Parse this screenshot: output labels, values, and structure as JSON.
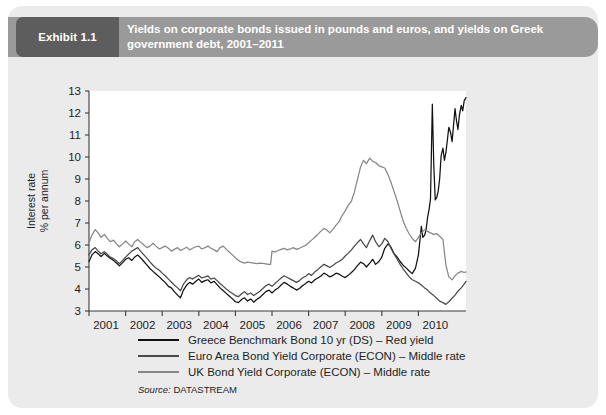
{
  "exhibit": {
    "badge": "Exhibit 1.1",
    "title": "Yields on corporate bonds issued in pounds and euros, and yields on Greek government debt, 2001–2011"
  },
  "source": {
    "label": "Source:",
    "value": "DATASTREAM"
  },
  "colors": {
    "card_background": "#ebebeb",
    "header_bar": "#9a9a9a",
    "badge": "#5d5d5d",
    "plot_background": "#ffffff",
    "greece": "#111111",
    "euro_area": "#4a4a4a",
    "uk": "#868686",
    "axis": "#3a3a3a"
  },
  "chart_data": {
    "type": "line",
    "title": "Yields on corporate bonds issued in pounds and euros, and yields on Greek government debt, 2001–2011",
    "xlabel": "",
    "ylabel": "Interest rate % per annum",
    "ylabel_lines": [
      "Interest rate",
      "% per annum"
    ],
    "ylim": [
      3,
      13
    ],
    "yticks": [
      3,
      4,
      5,
      6,
      7,
      8,
      9,
      10,
      11,
      12,
      13
    ],
    "xlim": [
      2001.0,
      2011.3
    ],
    "xticks": [
      2001,
      2002,
      2003,
      2004,
      2005,
      2006,
      2007,
      2008,
      2009,
      2010
    ],
    "xtick_labels": [
      "2001",
      "2002",
      "2003",
      "2004",
      "2005",
      "2006",
      "2007",
      "2008",
      "2009",
      "2010"
    ],
    "grid": false,
    "legend_position": "below-plot",
    "series": [
      {
        "name": "Greece Benchmark Bond 10 yr (DS) – Red yield",
        "color": "#111111",
        "x": [
          2001.0,
          2001.08,
          2001.17,
          2001.25,
          2001.33,
          2001.42,
          2001.5,
          2001.58,
          2001.67,
          2001.75,
          2001.83,
          2001.92,
          2002.0,
          2002.08,
          2002.17,
          2002.25,
          2002.33,
          2002.42,
          2002.5,
          2002.58,
          2002.67,
          2002.75,
          2002.83,
          2002.92,
          2003.0,
          2003.08,
          2003.17,
          2003.25,
          2003.33,
          2003.42,
          2003.5,
          2003.58,
          2003.67,
          2003.75,
          2003.83,
          2003.92,
          2004.0,
          2004.08,
          2004.17,
          2004.25,
          2004.33,
          2004.42,
          2004.5,
          2004.58,
          2004.67,
          2004.75,
          2004.83,
          2004.92,
          2005.0,
          2005.08,
          2005.17,
          2005.25,
          2005.33,
          2005.42,
          2005.5,
          2005.58,
          2005.67,
          2005.75,
          2005.83,
          2005.92,
          2006.0,
          2006.08,
          2006.17,
          2006.25,
          2006.33,
          2006.42,
          2006.5,
          2006.58,
          2006.67,
          2006.75,
          2006.83,
          2006.92,
          2007.0,
          2007.08,
          2007.17,
          2007.25,
          2007.33,
          2007.42,
          2007.5,
          2007.58,
          2007.67,
          2007.75,
          2007.83,
          2007.92,
          2008.0,
          2008.08,
          2008.17,
          2008.25,
          2008.33,
          2008.42,
          2008.5,
          2008.58,
          2008.67,
          2008.75,
          2008.83,
          2008.92,
          2009.0,
          2009.08,
          2009.17,
          2009.25,
          2009.33,
          2009.42,
          2009.5,
          2009.58,
          2009.67,
          2009.75,
          2009.83,
          2009.92,
          2010.0,
          2010.04,
          2010.08,
          2010.12,
          2010.17,
          2010.21,
          2010.25,
          2010.29,
          2010.33,
          2010.38,
          2010.42,
          2010.46,
          2010.5,
          2010.54,
          2010.58,
          2010.62,
          2010.67,
          2010.71,
          2010.75,
          2010.79,
          2010.83,
          2010.88,
          2010.92,
          2010.96,
          2011.0,
          2011.04,
          2011.08,
          2011.12,
          2011.17,
          2011.21,
          2011.25,
          2011.3
        ],
        "values": [
          5.25,
          5.55,
          5.7,
          5.6,
          5.48,
          5.62,
          5.5,
          5.4,
          5.3,
          5.18,
          5.05,
          5.2,
          5.35,
          5.42,
          5.3,
          5.45,
          5.55,
          5.4,
          5.25,
          5.1,
          4.92,
          4.8,
          4.68,
          4.55,
          4.42,
          4.3,
          4.12,
          4.05,
          3.88,
          3.72,
          3.6,
          3.95,
          4.18,
          4.3,
          4.22,
          4.35,
          4.45,
          4.3,
          4.38,
          4.42,
          4.28,
          4.35,
          4.2,
          4.05,
          3.92,
          3.8,
          3.68,
          3.55,
          3.42,
          3.38,
          3.52,
          3.6,
          3.45,
          3.55,
          3.4,
          3.52,
          3.62,
          3.75,
          3.88,
          3.95,
          3.82,
          3.95,
          4.05,
          4.18,
          4.3,
          4.22,
          4.12,
          4.05,
          3.95,
          4.02,
          4.15,
          4.25,
          4.35,
          4.28,
          4.42,
          4.5,
          4.58,
          4.72,
          4.65,
          4.55,
          4.62,
          4.72,
          4.68,
          4.58,
          4.52,
          4.62,
          4.75,
          4.88,
          5.05,
          5.22,
          5.15,
          5.0,
          5.18,
          5.35,
          5.12,
          5.25,
          5.45,
          5.85,
          6.05,
          5.9,
          5.62,
          5.45,
          5.25,
          5.08,
          4.95,
          4.82,
          4.7,
          4.95,
          5.55,
          6.2,
          6.85,
          6.35,
          6.45,
          6.7,
          7.25,
          7.6,
          8.1,
          12.4,
          9.6,
          8.05,
          8.15,
          8.45,
          9.0,
          10.05,
          10.4,
          9.85,
          10.2,
          10.75,
          11.35,
          11.1,
          10.7,
          11.45,
          12.2,
          11.65,
          11.25,
          11.9,
          12.35,
          12.1,
          12.55,
          12.7
        ]
      },
      {
        "name": "Euro Area Bond Yield Corporate (ECON) – Middle rate",
        "color": "#4a4a4a",
        "x": [
          2001.0,
          2001.08,
          2001.17,
          2001.25,
          2001.33,
          2001.42,
          2001.5,
          2001.58,
          2001.67,
          2001.75,
          2001.83,
          2001.92,
          2002.0,
          2002.08,
          2002.17,
          2002.25,
          2002.33,
          2002.42,
          2002.5,
          2002.58,
          2002.67,
          2002.75,
          2002.83,
          2002.92,
          2003.0,
          2003.08,
          2003.17,
          2003.25,
          2003.33,
          2003.42,
          2003.5,
          2003.58,
          2003.67,
          2003.75,
          2003.83,
          2003.92,
          2004.0,
          2004.08,
          2004.17,
          2004.25,
          2004.33,
          2004.42,
          2004.5,
          2004.58,
          2004.67,
          2004.75,
          2004.83,
          2004.92,
          2005.0,
          2005.08,
          2005.17,
          2005.25,
          2005.33,
          2005.42,
          2005.5,
          2005.58,
          2005.67,
          2005.75,
          2005.83,
          2005.92,
          2006.0,
          2006.08,
          2006.17,
          2006.25,
          2006.33,
          2006.42,
          2006.5,
          2006.58,
          2006.67,
          2006.75,
          2006.83,
          2006.92,
          2007.0,
          2007.08,
          2007.17,
          2007.25,
          2007.33,
          2007.42,
          2007.5,
          2007.58,
          2007.67,
          2007.75,
          2007.83,
          2007.92,
          2008.0,
          2008.08,
          2008.17,
          2008.25,
          2008.33,
          2008.42,
          2008.5,
          2008.58,
          2008.67,
          2008.75,
          2008.83,
          2008.92,
          2009.0,
          2009.08,
          2009.17,
          2009.25,
          2009.33,
          2009.42,
          2009.5,
          2009.58,
          2009.67,
          2009.75,
          2009.83,
          2009.92,
          2010.0,
          2010.08,
          2010.17,
          2010.25,
          2010.33,
          2010.42,
          2010.5,
          2010.58,
          2010.67,
          2010.75,
          2010.83,
          2010.92,
          2011.0,
          2011.08,
          2011.17,
          2011.25,
          2011.3
        ],
        "values": [
          5.55,
          5.78,
          5.88,
          5.72,
          5.6,
          5.7,
          5.58,
          5.45,
          5.38,
          5.28,
          5.15,
          5.3,
          5.45,
          5.58,
          5.72,
          5.8,
          5.88,
          5.7,
          5.55,
          5.4,
          5.22,
          5.08,
          4.95,
          4.85,
          4.72,
          4.6,
          4.45,
          4.32,
          4.18,
          4.05,
          3.92,
          4.22,
          4.42,
          4.52,
          4.45,
          4.55,
          4.62,
          4.5,
          4.55,
          4.6,
          4.45,
          4.5,
          4.38,
          4.25,
          4.12,
          4.0,
          3.9,
          3.8,
          3.7,
          3.65,
          3.78,
          3.88,
          3.75,
          3.82,
          3.7,
          3.8,
          3.9,
          4.02,
          4.15,
          4.22,
          4.12,
          4.25,
          4.38,
          4.5,
          4.6,
          4.52,
          4.45,
          4.38,
          4.3,
          4.38,
          4.5,
          4.58,
          4.7,
          4.62,
          4.78,
          4.88,
          5.0,
          5.12,
          5.05,
          4.98,
          5.08,
          5.18,
          5.25,
          5.35,
          5.5,
          5.62,
          5.78,
          5.95,
          6.1,
          6.25,
          6.05,
          5.88,
          6.2,
          6.45,
          6.15,
          5.92,
          6.05,
          6.3,
          6.15,
          5.85,
          5.6,
          5.35,
          5.12,
          4.92,
          4.72,
          4.55,
          4.42,
          4.35,
          4.28,
          4.18,
          4.05,
          3.95,
          3.82,
          3.7,
          3.58,
          3.45,
          3.38,
          3.3,
          3.42,
          3.58,
          3.72,
          3.9,
          4.05,
          4.22,
          4.35
        ]
      },
      {
        "name": "UK Bond Yield Corporate (ECON) – Middle rate",
        "color": "#868686",
        "x": [
          2001.0,
          2001.08,
          2001.17,
          2001.25,
          2001.33,
          2001.42,
          2001.5,
          2001.58,
          2001.67,
          2001.75,
          2001.83,
          2001.92,
          2002.0,
          2002.08,
          2002.17,
          2002.25,
          2002.33,
          2002.42,
          2002.5,
          2002.58,
          2002.67,
          2002.75,
          2002.83,
          2002.92,
          2003.0,
          2003.08,
          2003.17,
          2003.25,
          2003.33,
          2003.42,
          2003.5,
          2003.58,
          2003.67,
          2003.75,
          2003.83,
          2003.92,
          2004.0,
          2004.08,
          2004.17,
          2004.25,
          2004.33,
          2004.42,
          2004.5,
          2004.58,
          2004.67,
          2004.75,
          2004.83,
          2004.92,
          2005.0,
          2005.08,
          2005.17,
          2005.25,
          2005.33,
          2005.42,
          2005.5,
          2005.58,
          2005.67,
          2005.75,
          2005.83,
          2005.92,
          2005.96,
          2006.0,
          2006.08,
          2006.17,
          2006.25,
          2006.33,
          2006.42,
          2006.5,
          2006.58,
          2006.67,
          2006.75,
          2006.83,
          2006.92,
          2007.0,
          2007.08,
          2007.17,
          2007.25,
          2007.33,
          2007.42,
          2007.5,
          2007.58,
          2007.67,
          2007.75,
          2007.83,
          2007.92,
          2008.0,
          2008.08,
          2008.17,
          2008.25,
          2008.33,
          2008.42,
          2008.5,
          2008.58,
          2008.67,
          2008.75,
          2008.83,
          2008.92,
          2009.0,
          2009.08,
          2009.17,
          2009.25,
          2009.33,
          2009.42,
          2009.5,
          2009.58,
          2009.67,
          2009.75,
          2009.83,
          2009.92,
          2010.0,
          2010.08,
          2010.17,
          2010.25,
          2010.33,
          2010.42,
          2010.5,
          2010.58,
          2010.67,
          2010.75,
          2010.83,
          2010.92,
          2011.0,
          2011.08,
          2011.17,
          2011.25,
          2011.3
        ],
        "values": [
          6.1,
          6.45,
          6.7,
          6.55,
          6.35,
          6.48,
          6.3,
          6.15,
          6.22,
          6.05,
          5.92,
          6.05,
          6.18,
          6.05,
          5.92,
          6.15,
          6.25,
          6.12,
          6.0,
          5.88,
          5.95,
          6.08,
          5.95,
          5.82,
          5.88,
          5.95,
          5.85,
          5.72,
          5.8,
          5.88,
          5.75,
          5.82,
          5.9,
          5.78,
          5.85,
          5.92,
          5.95,
          5.82,
          5.88,
          5.95,
          5.85,
          5.78,
          5.7,
          5.88,
          5.95,
          5.8,
          5.68,
          5.55,
          5.42,
          5.3,
          5.22,
          5.18,
          5.22,
          5.2,
          5.18,
          5.15,
          5.18,
          5.16,
          5.14,
          5.12,
          5.12,
          5.72,
          5.68,
          5.75,
          5.8,
          5.85,
          5.78,
          5.82,
          5.88,
          5.8,
          5.85,
          5.92,
          5.98,
          6.1,
          6.22,
          6.35,
          6.48,
          6.62,
          6.75,
          6.68,
          6.55,
          6.72,
          6.9,
          7.05,
          7.35,
          7.55,
          7.8,
          8.0,
          8.4,
          8.95,
          9.55,
          9.85,
          9.7,
          9.95,
          9.8,
          9.75,
          9.6,
          9.55,
          9.5,
          9.2,
          8.85,
          8.45,
          8.0,
          7.55,
          7.1,
          6.75,
          6.5,
          6.3,
          6.15,
          6.35,
          6.55,
          6.7,
          6.62,
          6.55,
          6.48,
          6.52,
          6.4,
          6.25,
          5.1,
          4.55,
          4.42,
          4.6,
          4.72,
          4.8,
          4.75,
          4.78
        ]
      }
    ]
  },
  "legend": [
    {
      "label": "Greece Benchmark Bond 10 yr (DS) – Red yield",
      "color": "#111111"
    },
    {
      "label": "Euro Area Bond Yield Corporate (ECON) – Middle rate",
      "color": "#4a4a4a"
    },
    {
      "label": "UK Bond Yield Corporate (ECON) – Middle rate",
      "color": "#868686"
    }
  ]
}
